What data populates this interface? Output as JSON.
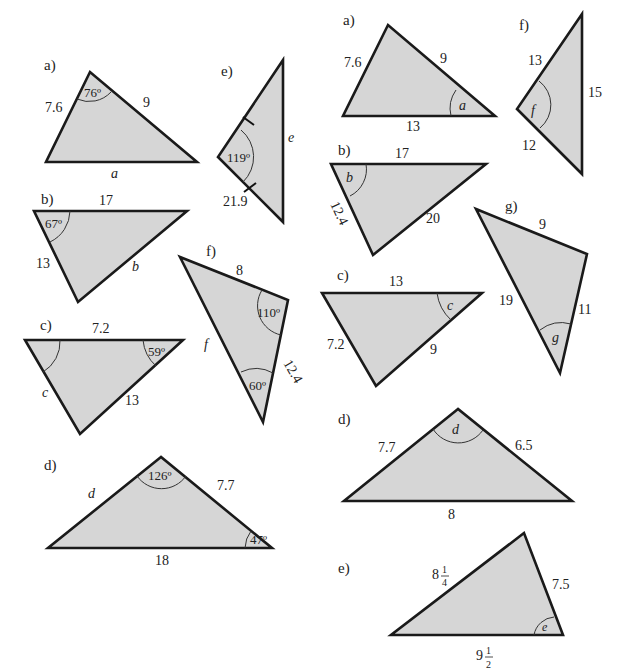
{
  "left_column": {
    "a": {
      "label": "a)",
      "side_left": "7.6",
      "side_right": "9",
      "angle": "76º",
      "unknown": "a"
    },
    "b": {
      "label": "b)",
      "side_top": "17",
      "side_left": "13",
      "angle": "67º",
      "unknown": "b"
    },
    "c": {
      "label": "c)",
      "side_top": "7.2",
      "side_right": "13",
      "angle": "59º",
      "unknown": "c"
    },
    "d": {
      "label": "d)",
      "side_right": "7.7",
      "side_bottom": "18",
      "angle_top": "126º",
      "angle_right": "47º",
      "unknown": "d"
    },
    "e": {
      "label": "e)",
      "side_bottom": "21.9",
      "angle": "119º",
      "unknown": "e"
    },
    "f": {
      "label": "f)",
      "side_top": "8",
      "side_right": "12.4",
      "angle_right": "110º",
      "angle_bottom": "60º",
      "unknown": "f"
    }
  },
  "right_column": {
    "a": {
      "label": "a)",
      "side_left": "7.6",
      "side_right": "9",
      "side_bottom": "13",
      "unknown": "a"
    },
    "b": {
      "label": "b)",
      "side_top": "17",
      "side_left": "12.4",
      "side_right": "20",
      "unknown": "b"
    },
    "c": {
      "label": "c)",
      "side_top": "13",
      "side_left": "7.2",
      "side_right": "9",
      "unknown": "c"
    },
    "d": {
      "label": "d)",
      "side_left": "7.7",
      "side_right": "6.5",
      "side_bottom": "8",
      "unknown": "d"
    },
    "e": {
      "label": "e)",
      "side_left_whole": "8",
      "side_left_num": "1",
      "side_left_den": "4",
      "side_right": "7.5",
      "side_bottom_whole": "9",
      "side_bottom_num": "1",
      "side_bottom_den": "2",
      "unknown": "e"
    },
    "f": {
      "label": "f)",
      "side_top": "13",
      "side_right": "15",
      "side_bottom": "12",
      "unknown": "f"
    },
    "g": {
      "label": "g)",
      "side_top": "9",
      "side_left": "19",
      "side_right": "11",
      "unknown": "g"
    }
  },
  "colors": {
    "fill": "#d6d6d6",
    "stroke": "#1a1a1a",
    "background": "#ffffff"
  }
}
